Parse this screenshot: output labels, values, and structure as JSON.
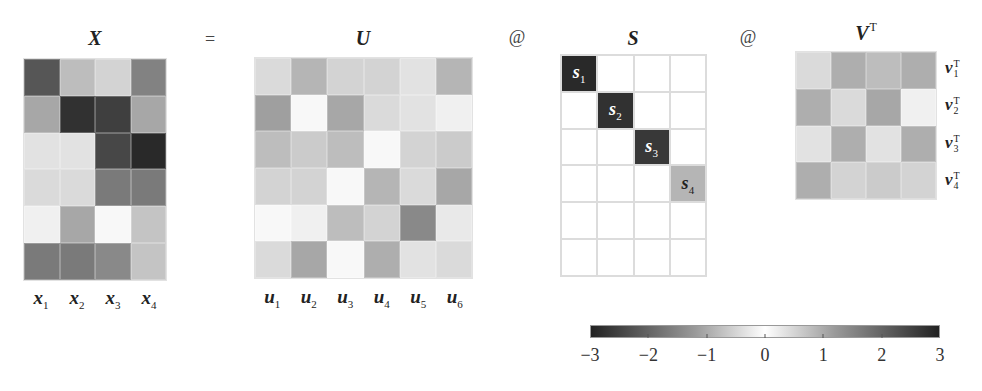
{
  "figure": {
    "equation": {
      "titles": {
        "X": "X",
        "U": "U",
        "S": "S",
        "V": "V",
        "V_sup": "T"
      },
      "operators": {
        "equals": "=",
        "matmul_1": "@",
        "matmul_2": "@"
      }
    },
    "matrices": {
      "X": {
        "rows": 6,
        "cols": 4,
        "values": [
          [
            -2.3,
            0.9,
            0.6,
            -1.7
          ],
          [
            -1.2,
            -2.8,
            -2.6,
            1.2
          ],
          [
            0.4,
            0.4,
            -2.5,
            -2.9
          ],
          [
            0.5,
            0.5,
            -1.8,
            -1.8
          ],
          [
            0.2,
            -1.2,
            0.1,
            0.8
          ],
          [
            -1.8,
            -1.8,
            -1.6,
            0.8
          ]
        ],
        "column_labels": [
          {
            "base": "x",
            "sub": "1"
          },
          {
            "base": "x",
            "sub": "2"
          },
          {
            "base": "x",
            "sub": "3"
          },
          {
            "base": "x",
            "sub": "4"
          }
        ]
      },
      "U": {
        "rows": 6,
        "cols": 6,
        "values": [
          [
            0.5,
            1.0,
            0.6,
            0.6,
            0.4,
            1.0
          ],
          [
            1.3,
            0.1,
            1.2,
            0.5,
            0.4,
            0.2
          ],
          [
            0.9,
            0.7,
            0.9,
            0.1,
            0.6,
            0.7
          ],
          [
            0.6,
            0.6,
            0.1,
            1.0,
            0.5,
            1.2
          ],
          [
            0.1,
            0.2,
            0.9,
            0.6,
            1.6,
            0.3
          ],
          [
            0.5,
            1.2,
            0.1,
            1.1,
            0.4,
            0.5
          ]
        ],
        "column_labels": [
          {
            "base": "u",
            "sub": "1"
          },
          {
            "base": "u",
            "sub": "2"
          },
          {
            "base": "u",
            "sub": "3"
          },
          {
            "base": "u",
            "sub": "4"
          },
          {
            "base": "u",
            "sub": "5"
          },
          {
            "base": "u",
            "sub": "6"
          }
        ]
      },
      "S": {
        "rows": 6,
        "cols": 4,
        "diagonal": [
          {
            "label": "s",
            "sub": "1",
            "value": 2.9
          },
          {
            "label": "s",
            "sub": "2",
            "value": 2.8
          },
          {
            "label": "s",
            "sub": "3",
            "value": 2.7
          },
          {
            "label": "s",
            "sub": "4",
            "value": 1.0
          }
        ]
      },
      "VT": {
        "rows": 4,
        "cols": 4,
        "values": [
          [
            0.5,
            1.1,
            0.9,
            1.1
          ],
          [
            1.1,
            0.5,
            1.2,
            0.2
          ],
          [
            0.4,
            1.1,
            0.4,
            1.1
          ],
          [
            1.1,
            0.6,
            0.7,
            0.6
          ]
        ],
        "row_labels": [
          {
            "base": "v",
            "sub": "1",
            "sup": "T"
          },
          {
            "base": "v",
            "sub": "2",
            "sup": "T"
          },
          {
            "base": "v",
            "sub": "3",
            "sup": "T"
          },
          {
            "base": "v",
            "sub": "4",
            "sup": "T"
          }
        ]
      }
    },
    "colorbar": {
      "min": -3,
      "max": 3,
      "ticks": [
        "−3",
        "−2",
        "−1",
        "0",
        "1",
        "2",
        "3"
      ],
      "colors": {
        "extreme": "#222222",
        "center": "#ffffff"
      }
    }
  }
}
